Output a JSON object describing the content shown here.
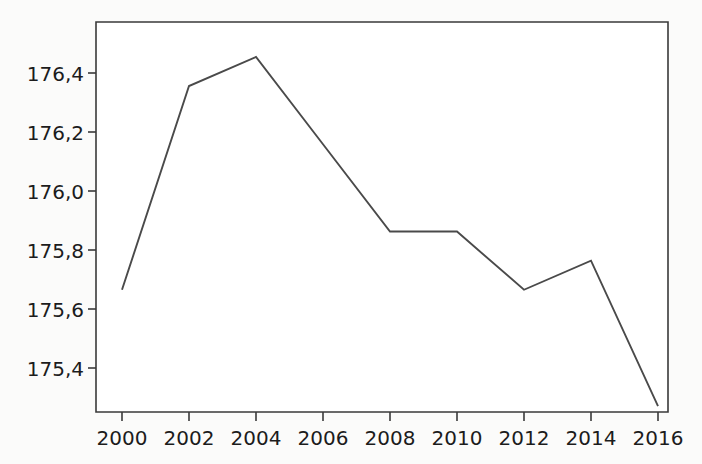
{
  "chart_data": {
    "type": "line",
    "title": "",
    "subtitle": "",
    "xlabel": "",
    "ylabel": "",
    "categories": [
      "2000",
      "2002",
      "2004",
      "2006",
      "2008",
      "2010",
      "2012",
      "2014",
      "2016"
    ],
    "x": [
      2000,
      2002,
      2004,
      2006,
      2008,
      2010,
      2012,
      2014,
      2016
    ],
    "values": [
      175.7,
      176.4,
      176.5,
      176.2,
      175.9,
      175.9,
      175.7,
      175.8,
      175.3
    ],
    "series": [
      {
        "name": "",
        "values": [
          175.7,
          176.4,
          176.5,
          176.2,
          175.9,
          175.9,
          175.7,
          175.8,
          175.3
        ]
      }
    ],
    "xlim": [
      2000,
      2016
    ],
    "ylim": [
      175.28,
      176.62
    ],
    "grid": false,
    "legend": false,
    "legend_position": "none",
    "decimal_separator": ",",
    "line_color": "#4a4a4a",
    "axis_color": "#3a3a3a",
    "background_color": "#ffffff",
    "y_ticks": [
      175.4,
      175.6,
      175.8,
      176.0,
      176.2,
      176.4
    ],
    "y_tick_labels": [
      "175,4",
      "175,6",
      "175,8",
      "176,0",
      "176,2",
      "176,4"
    ],
    "x_ticks": [
      2000,
      2002,
      2004,
      2006,
      2008,
      2010,
      2012,
      2014,
      2016
    ],
    "x_tick_labels": [
      "2000",
      "2002",
      "2004",
      "2006",
      "2008",
      "2010",
      "2012",
      "2014",
      "2016"
    ],
    "annotations": []
  },
  "axis": {
    "y_labels": [
      {
        "text": "176,4",
        "value": 176.4
      },
      {
        "text": "176,2",
        "value": 176.2
      },
      {
        "text": "176,0",
        "value": 176.0
      },
      {
        "text": "175,8",
        "value": 175.8
      },
      {
        "text": "175,6",
        "value": 175.6
      },
      {
        "text": "175,4",
        "value": 175.4
      }
    ],
    "x_labels": [
      {
        "text": "2000",
        "value": 2000
      },
      {
        "text": "2002",
        "value": 2002
      },
      {
        "text": "2004",
        "value": 2004
      },
      {
        "text": "2006",
        "value": 2006
      },
      {
        "text": "2008",
        "value": 2008
      },
      {
        "text": "2010",
        "value": 2010
      },
      {
        "text": "2012",
        "value": 2012
      },
      {
        "text": "2014",
        "value": 2014
      },
      {
        "text": "2016",
        "value": 2016
      }
    ]
  }
}
